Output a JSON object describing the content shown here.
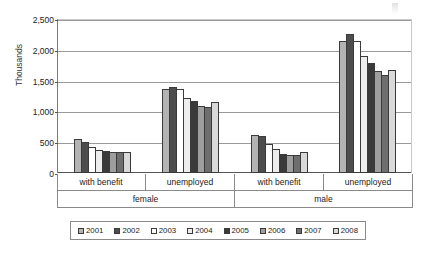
{
  "chart_data": {
    "type": "bar",
    "title": "",
    "subtitle": "",
    "xlabel": "",
    "ylabel": "Thousands",
    "ylim": [
      0,
      2500
    ],
    "yticks": [
      0,
      500,
      1000,
      1500,
      2000,
      2500
    ],
    "ytick_labels": [
      "0",
      "500",
      "1,000",
      "1,500",
      "2,000",
      "2,500"
    ],
    "grid": true,
    "legend_position": "bottom",
    "categories": [
      "with benefit",
      "unemployed",
      "with benefit",
      "unemployed"
    ],
    "supercategories": [
      "female",
      "male"
    ],
    "series": [
      {
        "name": "2001",
        "color": "#b3b3b3",
        "values": [
          560,
          1370,
          610,
          2150
        ]
      },
      {
        "name": "2002",
        "color": "#4d4d4d",
        "values": [
          500,
          1400,
          600,
          2250
        ]
      },
      {
        "name": "2003",
        "color": "#ffffff",
        "values": [
          420,
          1360,
          470,
          2150
        ]
      },
      {
        "name": "2004",
        "color": "#ededed",
        "values": [
          370,
          1215,
          385,
          1900
        ]
      },
      {
        "name": "2005",
        "color": "#3a3a3a",
        "values": [
          365,
          1165,
          310,
          1790
        ]
      },
      {
        "name": "2006",
        "color": "#9e9e9e",
        "values": [
          335,
          1080,
          300,
          1660
        ]
      },
      {
        "name": "2007",
        "color": "#6e6e6e",
        "values": [
          335,
          1065,
          295,
          1590
        ]
      },
      {
        "name": "2008",
        "color": "#d9d9d9",
        "values": [
          335,
          1145,
          345,
          1680
        ]
      }
    ]
  },
  "legend": {
    "items": [
      {
        "label": "2001"
      },
      {
        "label": "2002"
      },
      {
        "label": "2003"
      },
      {
        "label": "2004"
      },
      {
        "label": "2005"
      },
      {
        "label": "2006"
      },
      {
        "label": "2007"
      },
      {
        "label": "2008"
      }
    ]
  },
  "colors": {
    "grid": "#9a9a9a",
    "axis": "#555555",
    "bar_outline": "#3b3b3b",
    "text": "#1a1a1a",
    "background": "#ffffff"
  }
}
